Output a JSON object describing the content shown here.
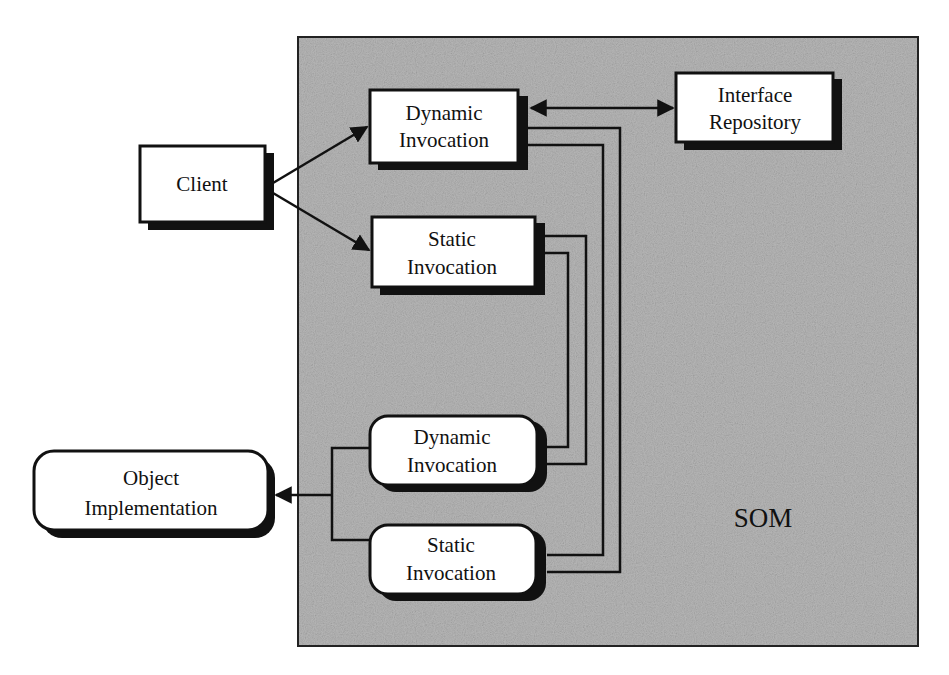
{
  "diagram": {
    "container": {
      "label": "SOM",
      "background_color": "#b8b8b8",
      "border_color": "#222222"
    },
    "nodes": {
      "client": {
        "lines": [
          "Client"
        ],
        "shape": "rectangle"
      },
      "dynamic_invocation_client": {
        "lines": [
          "Dynamic",
          "Invocation"
        ],
        "shape": "rectangle"
      },
      "static_invocation_client": {
        "lines": [
          "Static",
          "Invocation"
        ],
        "shape": "rectangle"
      },
      "interface_repository": {
        "lines": [
          "Interface",
          "Repository"
        ],
        "shape": "rectangle"
      },
      "dynamic_invocation_server": {
        "lines": [
          "Dynamic",
          "Invocation"
        ],
        "shape": "rounded"
      },
      "static_invocation_server": {
        "lines": [
          "Static",
          "Invocation"
        ],
        "shape": "rounded"
      },
      "object_implementation": {
        "lines": [
          "Object",
          "Implementation"
        ],
        "shape": "rounded"
      }
    },
    "edges": [
      {
        "from": "client",
        "to": "dynamic_invocation_client",
        "type": "arrow"
      },
      {
        "from": "client",
        "to": "static_invocation_client",
        "type": "arrow"
      },
      {
        "from": "dynamic_invocation_client",
        "to": "interface_repository",
        "type": "bidirectional-arrow"
      },
      {
        "from": "dynamic_invocation_client",
        "to": "static_invocation_server",
        "type": "double-line"
      },
      {
        "from": "static_invocation_client",
        "to": "dynamic_invocation_server",
        "type": "double-line"
      },
      {
        "from": "dynamic_invocation_server",
        "to": "object_implementation",
        "type": "arrow"
      },
      {
        "from": "static_invocation_server",
        "to": "object_implementation",
        "type": "arrow"
      }
    ],
    "colors": {
      "ink": "#111111",
      "box_fill": "#ffffff",
      "container_fill": "#b8b8b8"
    }
  }
}
